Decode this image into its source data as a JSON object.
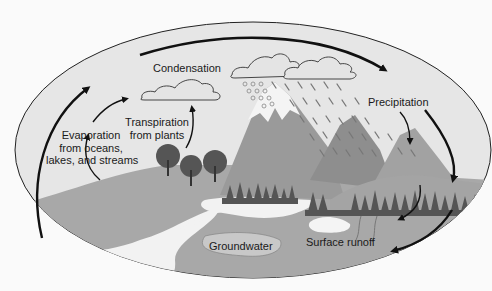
{
  "diagram": {
    "labels": {
      "condensation": "Condensation",
      "precipitation": "Precipitation",
      "evaporation_1": "Evaporation",
      "evaporation_2": "from oceans,",
      "evaporation_3": "lakes, and streams",
      "transpiration_1": "Transpiration",
      "transpiration_2": "from plants",
      "groundwater": "Groundwater",
      "surface_runoff": "Surface runoff"
    },
    "colors": {
      "background": "#fafafa",
      "sky": "#e6e6e6",
      "ground": "#a8a8a8",
      "mountain": "#9a9a9a",
      "snow": "#f4f4f4",
      "water": "#f2f2f2",
      "trees": "#555555",
      "arrow": "#111111"
    }
  }
}
